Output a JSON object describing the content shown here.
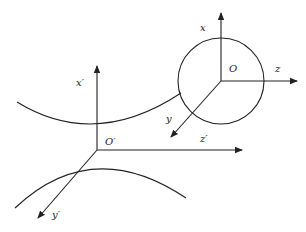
{
  "diagram": {
    "frames": [
      {
        "origin_label": "O",
        "axes": {
          "x": "x",
          "y": "y",
          "z": "z"
        },
        "enclosed_by": "circle"
      },
      {
        "origin_label": "O′",
        "axes": {
          "x": "x′",
          "y": "y′",
          "z": "z′"
        }
      }
    ],
    "curves": [
      "upper-arc",
      "lower-arc"
    ],
    "colors": {
      "stroke": "#222222",
      "background": "#ffffff"
    }
  }
}
